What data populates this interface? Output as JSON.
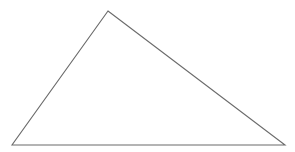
{
  "canvas": {
    "width": 295,
    "height": 152,
    "background_color": "#ffffff",
    "has_border": false,
    "has_text_labels": false
  },
  "figure": {
    "name": "triangle",
    "shape_type": "triangle",
    "classification": "scalene-obtuse",
    "fill": "none",
    "stroke_color": "#6b6b6b",
    "stroke_width": 1.1,
    "vertices": [
      {
        "label": "apex",
        "x": 108,
        "y": 11
      },
      {
        "label": "bottom-right",
        "x": 285,
        "y": 145
      },
      {
        "label": "bottom-left",
        "x": 12,
        "y": 145
      }
    ],
    "points_attr": "108,11 285,145 12,145",
    "edges": [
      {
        "name": "left-edge",
        "from": "bottom-left",
        "to": "apex"
      },
      {
        "name": "right-edge",
        "from": "apex",
        "to": "bottom-right"
      },
      {
        "name": "base-edge",
        "from": "bottom-left",
        "to": "bottom-right"
      }
    ]
  }
}
